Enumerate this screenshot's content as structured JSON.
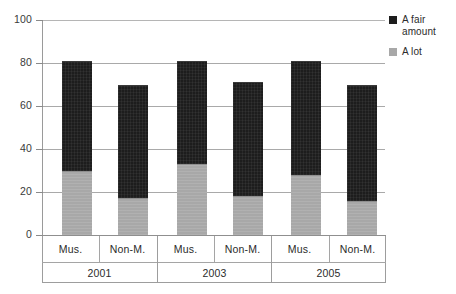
{
  "chart_data": {
    "type": "bar",
    "subtype": "stacked-grouped",
    "title": "",
    "xlabel": "",
    "ylabel": "",
    "ylim": [
      0,
      100
    ],
    "yticks": [
      0,
      20,
      40,
      60,
      80,
      100
    ],
    "ytick_labels": [
      "0",
      "20",
      "40",
      "60",
      "80",
      "100"
    ],
    "grid": true,
    "grid_axis": "y",
    "legend_position": "top-right",
    "groups": [
      "2001",
      "2003",
      "2005"
    ],
    "categories": [
      "Mus.",
      "Non-M.",
      "Mus.",
      "Non-M.",
      "Mus.",
      "Non-M."
    ],
    "series": [
      {
        "name": "A lot",
        "color": "#a8a8a8",
        "values": [
          30,
          17,
          33,
          18,
          28,
          16
        ]
      },
      {
        "name": "A fair amount",
        "color": "#1d1d1d",
        "values": [
          51,
          53,
          48,
          53,
          53,
          54
        ]
      }
    ],
    "totals": [
      81,
      70,
      81,
      71,
      81,
      70
    ],
    "bars": [
      {
        "group": "2001",
        "category": "Mus.",
        "a_lot": 30,
        "a_fair_amount": 51,
        "total": 81
      },
      {
        "group": "2001",
        "category": "Non-M.",
        "a_lot": 17,
        "a_fair_amount": 53,
        "total": 70
      },
      {
        "group": "2003",
        "category": "Mus.",
        "a_lot": 33,
        "a_fair_amount": 48,
        "total": 81
      },
      {
        "group": "2003",
        "category": "Non-M.",
        "a_lot": 18,
        "a_fair_amount": 53,
        "total": 71
      },
      {
        "group": "2005",
        "category": "Mus.",
        "a_lot": 28,
        "a_fair_amount": 53,
        "total": 81
      },
      {
        "group": "2005",
        "category": "Non-M.",
        "a_lot": 16,
        "a_fair_amount": 54,
        "total": 70
      }
    ]
  },
  "axis": {
    "y": {
      "ticks": [
        {
          "label": "100",
          "value": 100
        },
        {
          "label": "80",
          "value": 80
        },
        {
          "label": "60",
          "value": 60
        },
        {
          "label": "40",
          "value": 40
        },
        {
          "label": "20",
          "value": 20
        },
        {
          "label": "0",
          "value": 0
        }
      ]
    }
  },
  "legend": {
    "entries": [
      {
        "label": "A fair amount",
        "color": "#1d1d1d",
        "swatch": "dark-square-swatch"
      },
      {
        "label": "A lot",
        "color": "#a8a8a8",
        "swatch": "gray-square-swatch"
      }
    ]
  },
  "category_table": {
    "sub_labels": [
      "Mus.",
      "Non-M.",
      "Mus.",
      "Non-M.",
      "Mus.",
      "Non-M."
    ],
    "year_labels": [
      "2001",
      "2003",
      "2005"
    ]
  },
  "colors": {
    "a_lot": "#a8a8a8",
    "a_fair_amount": "#1d1d1d",
    "grid": "#a9a9a9",
    "axis": "#8f8f8f",
    "text": "#2b2b2b",
    "background": "#ffffff"
  }
}
